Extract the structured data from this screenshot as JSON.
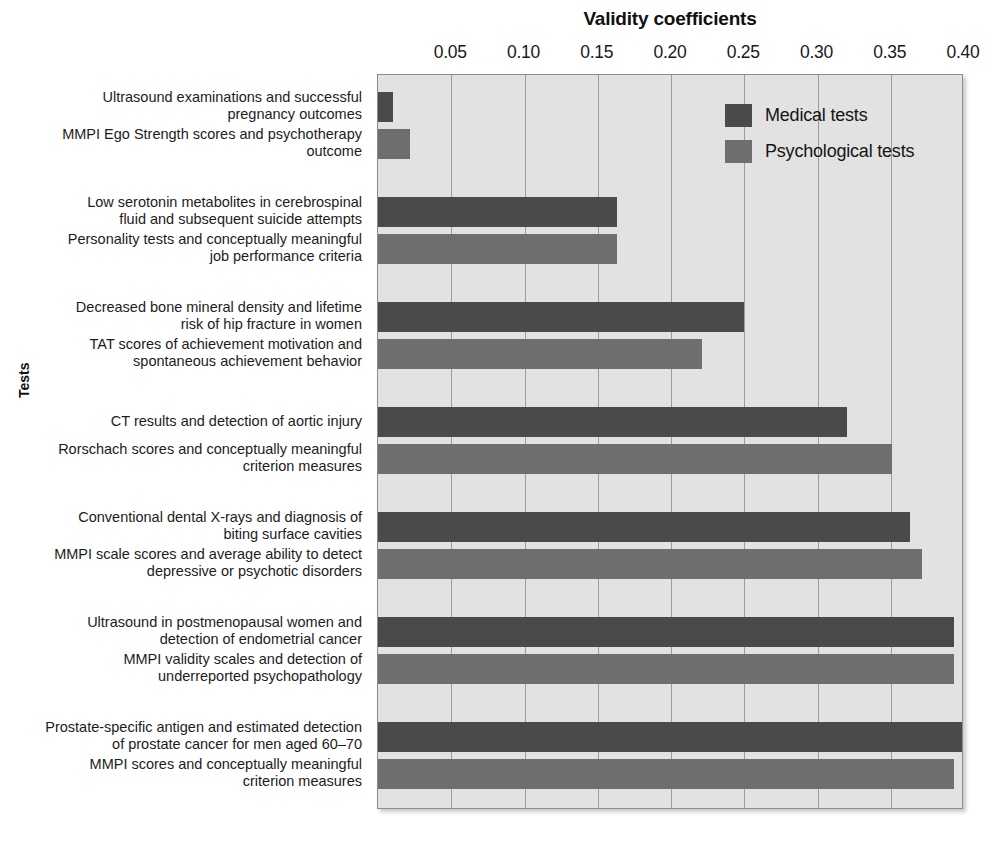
{
  "chart_data": {
    "type": "bar",
    "orientation": "horizontal",
    "title": "Validity coefficients",
    "xlabel": "Validity coefficients",
    "ylabel": "Tests",
    "xlim": [
      0.0,
      0.4
    ],
    "grid": true,
    "legend_position": "inside-top-right",
    "xticks": [
      0.05,
      0.1,
      0.15,
      0.2,
      0.25,
      0.3,
      0.35,
      0.4
    ],
    "xtick_labels": [
      "0.05",
      "0.10",
      "0.15",
      "0.20",
      "0.25",
      "0.30",
      "0.35",
      "0.40"
    ],
    "series": [
      {
        "name": "Medical tests",
        "color": "#4a4a4a"
      },
      {
        "name": "Psychological tests",
        "color": "#6e6e6e"
      }
    ],
    "groups": [
      {
        "medical_label": "Ultrasound examinations and successful\npregnancy outcomes",
        "medical_value": 0.01,
        "psych_label": "MMPI Ego Strength scores and psychotherapy\noutcome",
        "psych_value": 0.022
      },
      {
        "medical_label": "Low serotonin metabolites in cerebrospinal\nfluid and subsequent suicide attempts",
        "medical_value": 0.163,
        "psych_label": "Personality tests and conceptually meaningful\njob performance criteria",
        "psych_value": 0.163
      },
      {
        "medical_label": "Decreased bone mineral density and lifetime\nrisk of hip fracture in women",
        "medical_value": 0.25,
        "psych_label": "TAT scores of achievement motivation and\nspontaneous achievement behavior",
        "psych_value": 0.221
      },
      {
        "medical_label": "CT results and detection of aortic injury",
        "medical_value": 0.32,
        "psych_label": "Rorschach scores and conceptually meaningful\ncriterion measures",
        "psych_value": 0.351
      },
      {
        "medical_label": "Conventional dental X-rays and diagnosis of\nbiting surface cavities",
        "medical_value": 0.363,
        "psych_label": "MMPI scale scores and average ability to detect\ndepressive or psychotic disorders",
        "psych_value": 0.371
      },
      {
        "medical_label": "Ultrasound in postmenopausal women and\ndetection of endometrial cancer",
        "medical_value": 0.393,
        "psych_label": "MMPI validity scales and detection of\nunderreported psychopathology",
        "psych_value": 0.393
      },
      {
        "medical_label": "Prostate-specific antigen and estimated detection\nof prostate cancer for men aged 60–70",
        "medical_value": 0.402,
        "psych_label": "MMPI scores and conceptually meaningful\ncriterion measures",
        "psych_value": 0.393
      }
    ]
  },
  "legend": {
    "items": [
      {
        "label": "Medical tests",
        "series": "medical"
      },
      {
        "label": "Psychological tests",
        "series": "psych"
      }
    ]
  }
}
